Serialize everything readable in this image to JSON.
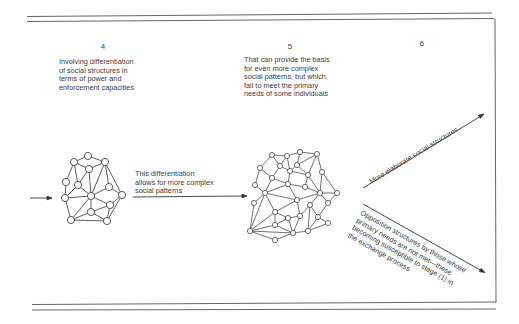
{
  "diagram": {
    "stages": [
      {
        "number": "4",
        "description": "Involving differentiation\nof social structures in\nterms of power and\nenforcement capacities"
      },
      {
        "number": "5",
        "description": "That can provide the basis\nfor even more complex\nsocial patterns, but which\nfail to meet the primary\nneeds of some individuals"
      },
      {
        "number": "6",
        "description": ""
      }
    ],
    "transitions": {
      "stage4_to_5": "This differentiation\nallows for more complex\nsocial patterns",
      "stage6_up": "More elaborate social structures",
      "stage6_down": "Opposition structures by those whose\nprimary needs are not met—these\nbecoming susceptible to stage (1) in\nthe exchange process"
    },
    "colors": {
      "line": "#333333",
      "rule": "#555555",
      "background": "#ffffff"
    }
  }
}
